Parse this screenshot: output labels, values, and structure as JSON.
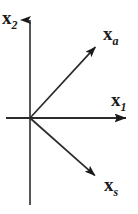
{
  "figure": {
    "type": "vector-diagram",
    "background_color": "#ffffff",
    "ink_color": "#1a1a1a",
    "width": 138,
    "height": 214
  },
  "chart_data": {
    "type": "scatter",
    "title": "",
    "subtitle": "",
    "xlabel": "x_1",
    "ylabel": "x_2",
    "grid": false,
    "legend": null,
    "axis_origin_px": [
      30,
      118
    ],
    "xlim": [
      -0.35,
      1.35
    ],
    "ylim": [
      -1.25,
      1.55
    ],
    "axes": [
      {
        "name": "horizontal-axis",
        "label": "x",
        "subscript": "1",
        "direction": "right",
        "arrowhead": true,
        "start_px": [
          6,
          118
        ],
        "end_px": [
          127,
          118
        ]
      },
      {
        "name": "vertical-axis",
        "label": "x",
        "subscript": "2",
        "direction": "up",
        "arrowhead": true,
        "start_px": [
          30,
          205
        ],
        "end_px": [
          30,
          10
        ]
      }
    ],
    "vectors": [
      {
        "name": "x_a",
        "label": "x",
        "subscript": "a",
        "arrowhead": true,
        "origin_px": [
          30,
          118
        ],
        "tip_px": [
          100,
          42
        ],
        "angle_deg": 47.4,
        "components": [
          0.7,
          0.76
        ]
      },
      {
        "name": "x_s",
        "label": "x",
        "subscript": "s",
        "arrowhead": true,
        "origin_px": [
          30,
          118
        ],
        "tip_px": [
          100,
          180
        ],
        "angle_deg": -41.5,
        "components": [
          0.7,
          -0.62
        ]
      }
    ]
  },
  "labels": {
    "x2": {
      "symbol": "x",
      "subscript": "2"
    },
    "xa": {
      "symbol": "x",
      "subscript": "a"
    },
    "x1": {
      "symbol": "x",
      "subscript": "1"
    },
    "xs": {
      "symbol": "x",
      "subscript": "s"
    }
  }
}
